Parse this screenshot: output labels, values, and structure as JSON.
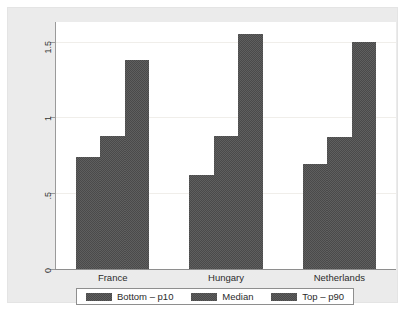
{
  "chart_data": {
    "type": "bar",
    "title": "",
    "subtitle": "",
    "xlabel": "",
    "ylabel": "",
    "categories": [
      "France",
      "Hungary",
      "Netherlands"
    ],
    "series": [
      {
        "name": "Bottom – p10",
        "values": [
          0.74,
          0.62,
          0.69
        ]
      },
      {
        "name": "Median",
        "values": [
          0.88,
          0.88,
          0.87
        ]
      },
      {
        "name": "Top – p90",
        "values": [
          1.38,
          1.55,
          1.5
        ]
      }
    ],
    "ylim": [
      0,
      1.63
    ],
    "yticks": [
      0,
      0.5,
      1,
      1.5
    ],
    "ytick_labels": [
      "0",
      ".5",
      "1",
      "1.5"
    ],
    "grid": "horizontal-faint",
    "legend_position": "bottom",
    "bar_color": "#5f5f5f",
    "panel_background": "#ffffff",
    "figure_background": "#ebebeb",
    "axis_color": "#8e8e8e",
    "gridline_color": "#f0eeea",
    "annotations": []
  },
  "axis": {
    "y_tick_labels": [
      "0",
      ".5",
      "1",
      "1.5"
    ]
  },
  "legend": {
    "entries": [
      {
        "label": "Bottom – p10"
      },
      {
        "label": "Median"
      },
      {
        "label": "Top – p90"
      }
    ]
  }
}
